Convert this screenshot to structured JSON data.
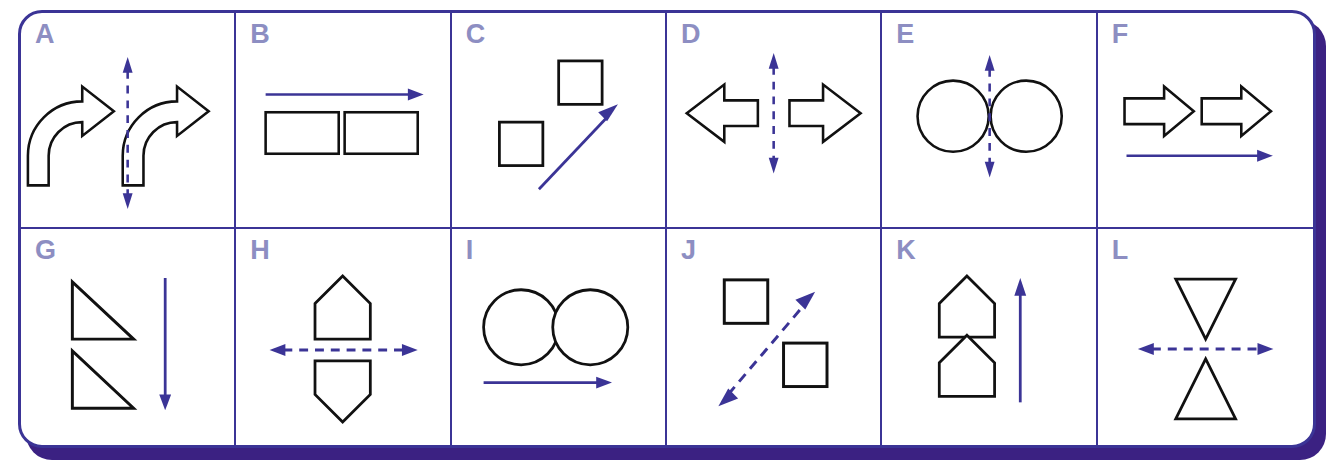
{
  "panel": {
    "title": "",
    "frame_color": "#3b3496",
    "shadow_color": "#3b2182",
    "label_color": "#8d8ec2",
    "shape_color": "#111111",
    "arrow_color": "#3b3496",
    "rows": 2,
    "columns": 6
  },
  "cells": [
    {
      "id": "A",
      "label": "A",
      "shapes": "two-curved-block-arrows",
      "shape_description": "left-curving block arrow and right-curving block arrow",
      "arrow": "vertical-dashed-double-arrow",
      "arrow_style": "dashed",
      "arrow_direction": "vertical-bidirectional"
    },
    {
      "id": "B",
      "label": "B",
      "shapes": "two-rectangles",
      "shape_description": "two horizontal rectangles side by side",
      "arrow": "horizontal-solid-arrow-right",
      "arrow_style": "solid",
      "arrow_direction": "right",
      "arrow_position": "above"
    },
    {
      "id": "C",
      "label": "C",
      "shapes": "two-squares-diagonal",
      "shape_description": "square upper-right and square lower-left",
      "arrow": "diagonal-solid-arrow-up-right",
      "arrow_style": "solid",
      "arrow_direction": "up-right"
    },
    {
      "id": "D",
      "label": "D",
      "shapes": "two-block-arrows-outward",
      "shape_description": "left-pointing block arrow and right-pointing block arrow",
      "arrow": "vertical-dashed-double-arrow",
      "arrow_style": "dashed",
      "arrow_direction": "vertical-bidirectional"
    },
    {
      "id": "E",
      "label": "E",
      "shapes": "two-circles",
      "shape_description": "two circles side by side",
      "arrow": "vertical-dashed-double-arrow",
      "arrow_style": "dashed",
      "arrow_direction": "vertical-bidirectional"
    },
    {
      "id": "F",
      "label": "F",
      "shapes": "two-block-arrows-right",
      "shape_description": "two identical right-pointing block arrows",
      "arrow": "horizontal-solid-arrow-right",
      "arrow_style": "solid",
      "arrow_direction": "right",
      "arrow_position": "below"
    },
    {
      "id": "G",
      "label": "G",
      "shapes": "two-right-triangles-stacked",
      "shape_description": "two identical right triangles stacked vertically",
      "arrow": "vertical-solid-arrow-down",
      "arrow_style": "solid",
      "arrow_direction": "down",
      "arrow_position": "right"
    },
    {
      "id": "H",
      "label": "H",
      "shapes": "two-pentagons-mirrored",
      "shape_description": "upward house pentagon above, downward mirrored pentagon below",
      "arrow": "horizontal-dashed-double-arrow",
      "arrow_style": "dashed",
      "arrow_direction": "horizontal-bidirectional"
    },
    {
      "id": "I",
      "label": "I",
      "shapes": "two-circles",
      "shape_description": "two circles side by side",
      "arrow": "horizontal-solid-arrow-right",
      "arrow_style": "solid",
      "arrow_direction": "right",
      "arrow_position": "below"
    },
    {
      "id": "J",
      "label": "J",
      "shapes": "two-squares-diagonal",
      "shape_description": "square upper-left and square lower-right",
      "arrow": "diagonal-dashed-double-arrow",
      "arrow_style": "dashed",
      "arrow_direction": "diagonal-bidirectional"
    },
    {
      "id": "K",
      "label": "K",
      "shapes": "two-pentagons-stacked",
      "shape_description": "two identical house pentagons stacked vertically",
      "arrow": "vertical-solid-arrow-up",
      "arrow_style": "solid",
      "arrow_direction": "up",
      "arrow_position": "right"
    },
    {
      "id": "L",
      "label": "L",
      "shapes": "two-triangles-mirrored",
      "shape_description": "downward triangle above, upward triangle below",
      "arrow": "horizontal-dashed-double-arrow",
      "arrow_style": "dashed",
      "arrow_direction": "horizontal-bidirectional"
    }
  ]
}
